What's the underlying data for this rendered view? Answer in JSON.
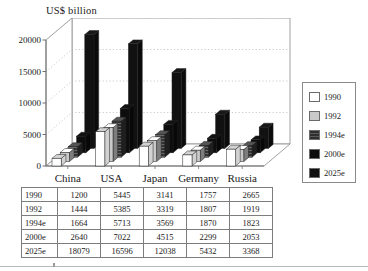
{
  "chart_data": {
    "type": "bar",
    "title": "US$ billion",
    "xlabel": "",
    "ylabel": "US$ billion",
    "ylim": [
      0,
      20000
    ],
    "yticks": [
      0,
      5000,
      10000,
      15000,
      20000
    ],
    "ytick_labels": [
      "0",
      "5000",
      "10000",
      "15000",
      "20000"
    ],
    "grid": true,
    "grid_style": "dotted-horizontal",
    "projection": "3d-grouped-depth",
    "legend_position": "right-outside",
    "categories": [
      "China",
      "USA",
      "Japan",
      "Germany",
      "Russia"
    ],
    "series": [
      {
        "name": "1990",
        "color": "#ffffff",
        "values": [
          1200,
          5445,
          3141,
          1757,
          2665
        ]
      },
      {
        "name": "1992",
        "color": "#c9c9c9",
        "values": [
          1444,
          5385,
          3319,
          1807,
          1919
        ]
      },
      {
        "name": "1994e",
        "color": "#3a3a3a",
        "values": [
          1664,
          5713,
          3569,
          1870,
          1823
        ]
      },
      {
        "name": "2000e",
        "color": "#0d0d0d",
        "values": [
          2640,
          7022,
          4515,
          2299,
          2053
        ]
      },
      {
        "name": "2025e",
        "color": "#111111",
        "values": [
          18079,
          16596,
          12038,
          5432,
          3368
        ]
      }
    ]
  },
  "legend": {
    "items": [
      {
        "label": "1990",
        "swatch": "#ffffff"
      },
      {
        "label": "1992",
        "swatch": "#c9c9c9"
      },
      {
        "label": "1994e",
        "swatch": "#3a3a3a"
      },
      {
        "label": "2000e",
        "swatch": "#0d0d0d"
      },
      {
        "label": "2025e",
        "swatch": "#111111"
      }
    ]
  },
  "table": {
    "row_headers": [
      "1990",
      "1992",
      "1994e",
      "2000e",
      "2025e"
    ],
    "columns": [
      "China",
      "USA",
      "Japan",
      "Germany",
      "Russia"
    ],
    "rows": [
      {
        "header": "1990",
        "cells": [
          "1200",
          "5445",
          "3141",
          "1757",
          "2665"
        ]
      },
      {
        "header": "1992",
        "cells": [
          "1444",
          "5385",
          "3319",
          "1807",
          "1919"
        ]
      },
      {
        "header": "1994e",
        "cells": [
          "1664",
          "5713",
          "3569",
          "1870",
          "1823"
        ]
      },
      {
        "header": "2000e",
        "cells": [
          "2640",
          "7022",
          "4515",
          "2299",
          "2053"
        ]
      },
      {
        "header": "2025e",
        "cells": [
          "18079",
          "16596",
          "12038",
          "5432",
          "3368"
        ]
      }
    ]
  },
  "colors": {
    "axis": "#6f6f6f",
    "grid": "#b5b5b5",
    "frame": "#8a8a8a",
    "floor": "#ffffff",
    "text": "#1a1a1a"
  }
}
